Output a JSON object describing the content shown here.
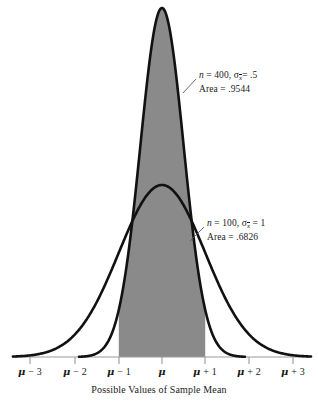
{
  "chart_data": {
    "type": "area",
    "title": "",
    "xlabel": "Possible Values of Sample Mean",
    "ylabel": "",
    "grid": false,
    "legend_position": "inline-annotations",
    "x_tick_labels": [
      "μ − 3",
      "μ − 2",
      "μ − 1",
      "μ",
      "μ + 1",
      "μ + 2",
      "μ + 3"
    ],
    "x_tick_values": [
      -3,
      -2,
      -1,
      0,
      1,
      2,
      3
    ],
    "xlim": [
      -3.5,
      3.5
    ],
    "shaded_region": {
      "from": -1,
      "to": 1,
      "color": "#8a8a8a",
      "description": "Region between μ − 1 and μ + 1"
    },
    "series": [
      {
        "name": "n = 400",
        "n": 400,
        "sigma_xbar": 0.5,
        "area": 0.9544,
        "peak_height": 1.0,
        "curve_color": "#111111"
      },
      {
        "name": "n = 100",
        "n": 100,
        "sigma_xbar": 1,
        "area": 0.6826,
        "peak_height": 0.5,
        "curve_color": "#111111"
      }
    ]
  },
  "annotations": {
    "curve_400": {
      "n_prefix": "n",
      "n_text": " = 400, ",
      "sigma": "σ",
      "sigma_subscript": "x",
      "sigma_value": "= .5",
      "area_label": "Area = .9544"
    },
    "curve_100": {
      "n_prefix": "n",
      "n_text": " = 100, ",
      "sigma": "σ",
      "sigma_subscript": "x",
      "sigma_value": " = 1",
      "area_label": "Area = .6826"
    }
  },
  "axis": {
    "title": "Possible Values of Sample Mean",
    "ticks": [
      {
        "label_mu": "μ",
        "label_rest": " − 3",
        "x": 30
      },
      {
        "label_mu": "μ",
        "label_rest": " − 2",
        "x": 75
      },
      {
        "label_mu": "μ",
        "label_rest": " − 1",
        "x": 119
      },
      {
        "label_mu": "μ",
        "label_rest": "",
        "x": 162
      },
      {
        "label_mu": "μ",
        "label_rest": " + 1",
        "x": 205
      },
      {
        "label_mu": "μ",
        "label_rest": " + 2",
        "x": 249
      },
      {
        "label_mu": "μ",
        "label_rest": " + 3",
        "x": 293
      }
    ]
  },
  "colors": {
    "fill": "#8a8a8a",
    "curve": "#111111",
    "axis": "#9a9a9a",
    "text": "#1a1a1a"
  }
}
